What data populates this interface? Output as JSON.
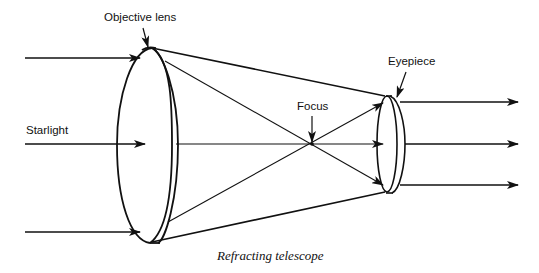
{
  "diagram": {
    "title": "Refracting telescope",
    "labels": {
      "objective_lens": "Objective lens",
      "eyepiece": "Eyepiece",
      "focus": "Focus",
      "starlight": "Starlight"
    },
    "caption": "Refracting telescope",
    "components": [
      {
        "name": "Objective lens",
        "type": "convex lens (large)"
      },
      {
        "name": "Eyepiece",
        "type": "convex lens (small)"
      },
      {
        "name": "Focus",
        "type": "focal point"
      }
    ],
    "rays": {
      "incoming_count": 3,
      "outgoing_count": 3,
      "incoming_label": "Starlight"
    },
    "colors": {
      "line": "#111111",
      "background": "#ffffff"
    }
  }
}
